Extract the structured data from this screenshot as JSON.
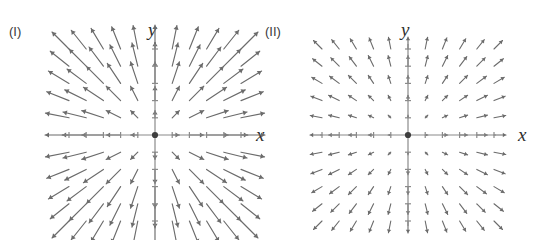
{
  "figure": {
    "width": 543,
    "height": 240,
    "background_color": "#ffffff",
    "stroke_color": "#6b6b6b",
    "axis_color": "#8a8a8a",
    "origin_dot_color": "#3d3d3d",
    "label_color": "#3a3a3a"
  },
  "panels": [
    {
      "id": "panel-1",
      "label": "(I)",
      "x_axis_label": "x",
      "y_axis_label": "y",
      "origin": {
        "x": 155,
        "y": 135
      },
      "grid_spacing": 17.2,
      "grid_half_count": 5,
      "axis_half_length_x": 92,
      "axis_half_length_y": 91,
      "tick_half_length": 3,
      "origin_dot_radius": 3.1,
      "field_type": "radial-outward",
      "arrow_scale": 0.42,
      "arrow_min_length": 2.0,
      "arrow_max_length": 24,
      "arrow_head_length": 4.0,
      "arrow_head_width": 2.6,
      "arrow_stroke_width": 1.15,
      "description": "Radial outward vector field with magnitude increasing linearly with distance from origin"
    },
    {
      "id": "panel-2",
      "label": "(II)",
      "x_axis_label": "x",
      "y_axis_label": "y",
      "origin": {
        "x": 136,
        "y": 135
      },
      "grid_spacing": 17.2,
      "grid_half_count": 5,
      "axis_half_length_x": 88,
      "axis_half_length_y": 91,
      "tick_half_length": 3,
      "origin_dot_radius": 3.1,
      "field_type": "radial-outward",
      "arrow_scale": 0.155,
      "arrow_min_length": 1.6,
      "arrow_max_length": 12,
      "arrow_head_length": 3.2,
      "arrow_head_width": 2.2,
      "arrow_stroke_width": 1.1,
      "description": "Radial outward vector field with short arrows, magnitude increasing slowly with distance from origin"
    }
  ],
  "chart_data": {
    "type": "scatter",
    "title": "",
    "xlabel": "x",
    "ylabel": "y",
    "grid": false,
    "legend": "none",
    "plots": [
      {
        "name": "(I)",
        "field": "F(x,y) = (x, y)",
        "xlim": [
          -5,
          5
        ],
        "ylim": [
          -5,
          5
        ],
        "samples_per_axis": 11,
        "note": "Arrows point radially away from the origin; length proportional to distance r"
      },
      {
        "name": "(II)",
        "field": "F(x,y) = c (x, y), small c",
        "xlim": [
          -5,
          5
        ],
        "ylim": [
          -5,
          5
        ],
        "samples_per_axis": 11,
        "note": "Arrows point radially away from the origin; uniformly short lengths"
      }
    ]
  }
}
